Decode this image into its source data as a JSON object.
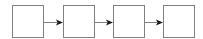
{
  "diagram": {
    "type": "flow",
    "direction": "left-to-right",
    "nodes": [
      {
        "id": "box-1",
        "label": "",
        "x": 12.5,
        "y": 5.5,
        "w": 31,
        "h": 32
      },
      {
        "id": "box-2",
        "label": "",
        "x": 63.5,
        "y": 5.5,
        "w": 31,
        "h": 32
      },
      {
        "id": "box-3",
        "label": "",
        "x": 113.5,
        "y": 5.5,
        "w": 31,
        "h": 32
      },
      {
        "id": "box-4",
        "label": "",
        "x": 163.5,
        "y": 5.5,
        "w": 31,
        "h": 32
      }
    ],
    "edges": [
      {
        "from": "box-1",
        "to": "box-2"
      },
      {
        "from": "box-2",
        "to": "box-3"
      },
      {
        "from": "box-3",
        "to": "box-4"
      }
    ],
    "colors": {
      "stroke": "#808080",
      "arrow": "#1a1a1a",
      "fill": "#ffffff"
    }
  }
}
